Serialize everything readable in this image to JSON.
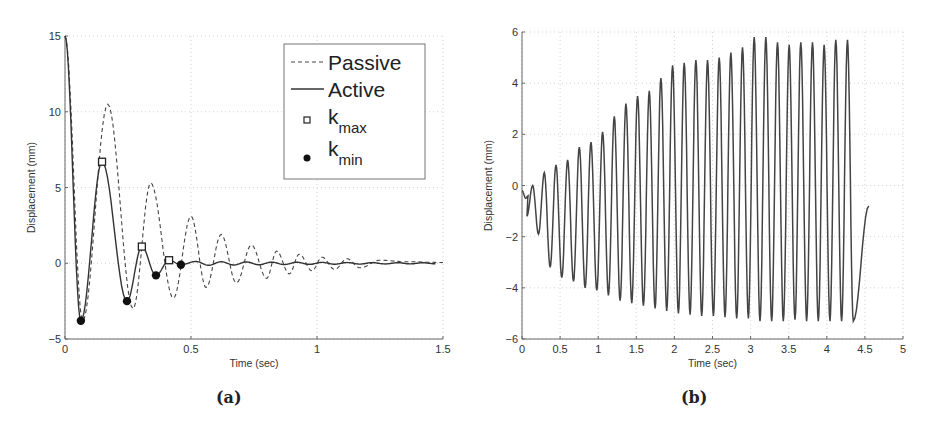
{
  "chart_data": [
    {
      "id": "a",
      "type": "line",
      "caption": "(a)",
      "title": "",
      "xlabel": "Time (sec)",
      "ylabel": "Displacement (mm)",
      "xlim": [
        0,
        1.5
      ],
      "ylim": [
        -5,
        15
      ],
      "xticks": [
        "0",
        "0.5",
        "1",
        "1.5"
      ],
      "yticks": [
        "-5",
        "0",
        "5",
        "10",
        "15"
      ],
      "grid": true,
      "legend": {
        "position": "upper right",
        "entries": [
          {
            "label": "Passive",
            "style": "dashed line"
          },
          {
            "label": "Active",
            "style": "solid line"
          },
          {
            "label": "k",
            "sub": "max",
            "style": "open square marker"
          },
          {
            "label": "k",
            "sub": "min",
            "style": "filled circle marker"
          }
        ]
      },
      "series": [
        {
          "name": "Passive",
          "style": "dashed",
          "peaks": [
            {
              "x": 0.0,
              "y": 15
            },
            {
              "x": 0.07,
              "y": -3.8
            },
            {
              "x": 0.17,
              "y": 10.5
            },
            {
              "x": 0.27,
              "y": -3.0
            },
            {
              "x": 0.34,
              "y": 5.3
            },
            {
              "x": 0.43,
              "y": -2.3
            },
            {
              "x": 0.5,
              "y": 3.1
            },
            {
              "x": 0.56,
              "y": -1.6
            },
            {
              "x": 0.62,
              "y": 1.9
            },
            {
              "x": 0.68,
              "y": -1.3
            },
            {
              "x": 0.74,
              "y": 1.2
            },
            {
              "x": 0.8,
              "y": -1.0
            },
            {
              "x": 0.84,
              "y": 0.8
            },
            {
              "x": 0.89,
              "y": -0.7
            },
            {
              "x": 0.93,
              "y": 0.6
            },
            {
              "x": 0.98,
              "y": -0.5
            },
            {
              "x": 1.02,
              "y": 0.4
            },
            {
              "x": 1.07,
              "y": -0.4
            },
            {
              "x": 1.12,
              "y": 0.3
            },
            {
              "x": 1.17,
              "y": -0.3
            },
            {
              "x": 1.25,
              "y": 0.2
            },
            {
              "x": 1.35,
              "y": 0.1
            },
            {
              "x": 1.5,
              "y": 0.05
            }
          ]
        },
        {
          "name": "Active",
          "style": "solid",
          "peaks": [
            {
              "x": 0.0,
              "y": 15
            },
            {
              "x": 0.063,
              "y": -3.8
            },
            {
              "x": 0.147,
              "y": 6.7
            },
            {
              "x": 0.246,
              "y": -2.5
            },
            {
              "x": 0.305,
              "y": 1.1
            },
            {
              "x": 0.361,
              "y": -0.8
            },
            {
              "x": 0.413,
              "y": 0.2
            },
            {
              "x": 0.46,
              "y": -0.1
            },
            {
              "x": 0.6,
              "y": 0.0
            },
            {
              "x": 1.5,
              "y": 0.0
            }
          ]
        },
        {
          "name": "k_max",
          "style": "marker-square",
          "points": [
            {
              "x": 0.147,
              "y": 6.7
            },
            {
              "x": 0.305,
              "y": 1.1
            },
            {
              "x": 0.413,
              "y": 0.2
            }
          ]
        },
        {
          "name": "k_min",
          "style": "marker-circle",
          "points": [
            {
              "x": 0.063,
              "y": -3.8
            },
            {
              "x": 0.246,
              "y": -2.5
            },
            {
              "x": 0.361,
              "y": -0.8
            },
            {
              "x": 0.46,
              "y": -0.1
            }
          ]
        }
      ]
    },
    {
      "id": "b",
      "type": "line",
      "caption": "(b)",
      "title": "",
      "xlabel": "Time (sec)",
      "ylabel": "Displacement (mm)",
      "xlim": [
        0,
        5
      ],
      "ylim": [
        -6,
        6
      ],
      "xticks": [
        "0",
        "0.5",
        "1",
        "1.5",
        "2",
        "2.5",
        "3",
        "3.5",
        "4",
        "4.5",
        "5"
      ],
      "yticks": [
        "-6",
        "-4",
        "-2",
        "0",
        "2",
        "4",
        "6"
      ],
      "grid": true,
      "series": [
        {
          "name": "Displacement",
          "style": "solid",
          "start": {
            "x": 0.0,
            "y": -0.2
          },
          "period": 0.153,
          "first_peak_t": 0.14,
          "peaks": [
            0.0,
            0.5,
            0.8,
            1.0,
            1.5,
            1.7,
            2.1,
            2.7,
            3.2,
            3.5,
            3.7,
            4.2,
            4.7,
            4.8,
            4.9,
            4.9,
            5.0,
            5.2,
            5.4,
            5.8,
            5.8,
            5.6,
            5.5,
            5.6,
            5.6,
            5.5,
            5.7,
            5.7
          ],
          "troughs": [
            -1.2,
            -1.9,
            -3.2,
            -3.6,
            -3.75,
            -4.0,
            -4.1,
            -4.3,
            -4.5,
            -4.6,
            -4.7,
            -4.8,
            -4.9,
            -5.0,
            -5.05,
            -5.1,
            -5.1,
            -5.15,
            -5.2,
            -5.2,
            -5.3,
            -5.3,
            -5.3,
            -5.25,
            -5.3,
            -5.3,
            -5.3,
            -5.3,
            -5.3
          ],
          "end": {
            "x": 4.55,
            "y": -0.8
          }
        }
      ]
    }
  ]
}
